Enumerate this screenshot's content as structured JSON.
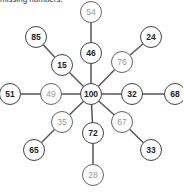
{
  "caption": "missing numbers.",
  "center": {
    "x": 91,
    "y": 94,
    "label": "100"
  },
  "nodes": [
    {
      "id": "n54",
      "x": 91,
      "y": 12,
      "label": "54",
      "style": "light"
    },
    {
      "id": "n46",
      "x": 91,
      "y": 53,
      "label": "46",
      "style": "bold"
    },
    {
      "id": "n85",
      "x": 36,
      "y": 37,
      "label": "85",
      "style": "bold"
    },
    {
      "id": "n15",
      "x": 62,
      "y": 65,
      "label": "15",
      "style": "bold"
    },
    {
      "id": "n24",
      "x": 151,
      "y": 37,
      "label": "24",
      "style": "bold"
    },
    {
      "id": "n76",
      "x": 122,
      "y": 62,
      "label": "76",
      "style": "light"
    },
    {
      "id": "n51",
      "x": 10,
      "y": 94,
      "label": "51",
      "style": "bold"
    },
    {
      "id": "n49",
      "x": 51,
      "y": 94,
      "label": "49",
      "style": "light"
    },
    {
      "id": "n32",
      "x": 132,
      "y": 94,
      "label": "32",
      "style": "bold"
    },
    {
      "id": "n68",
      "x": 175,
      "y": 94,
      "label": "68",
      "style": "bold"
    },
    {
      "id": "n35",
      "x": 62,
      "y": 122,
      "label": "35",
      "style": "light"
    },
    {
      "id": "n65",
      "x": 34,
      "y": 150,
      "label": "65",
      "style": "bold"
    },
    {
      "id": "n72",
      "x": 93,
      "y": 133,
      "label": "72",
      "style": "bold"
    },
    {
      "id": "n28",
      "x": 93,
      "y": 175,
      "label": "28",
      "style": "light"
    },
    {
      "id": "n67",
      "x": 122,
      "y": 122,
      "label": "67",
      "style": "light"
    },
    {
      "id": "n33",
      "x": 151,
      "y": 150,
      "label": "33",
      "style": "bold"
    }
  ],
  "edges": [
    [
      "center",
      "n46"
    ],
    [
      "n46",
      "n54"
    ],
    [
      "center",
      "n15"
    ],
    [
      "n15",
      "n85"
    ],
    [
      "center",
      "n76"
    ],
    [
      "n76",
      "n24"
    ],
    [
      "center",
      "n49"
    ],
    [
      "n49",
      "n51"
    ],
    [
      "center",
      "n32"
    ],
    [
      "n32",
      "n68"
    ],
    [
      "center",
      "n35"
    ],
    [
      "n35",
      "n65"
    ],
    [
      "center",
      "n72"
    ],
    [
      "n72",
      "n28"
    ],
    [
      "center",
      "n67"
    ],
    [
      "n67",
      "n33"
    ]
  ],
  "colors": {
    "edge": "#555555",
    "stroke": "#444444",
    "bold_text": "#222222",
    "light_text": "#999999"
  }
}
